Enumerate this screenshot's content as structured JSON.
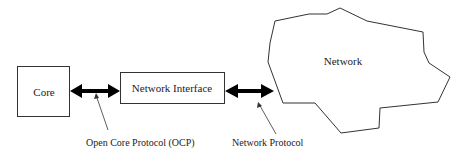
{
  "diagram": {
    "nodes": {
      "core": {
        "label": "Core"
      },
      "network_interface": {
        "label": "Network Interface"
      },
      "network": {
        "label": "Network"
      }
    },
    "connections": [
      {
        "from": "core",
        "to": "network_interface",
        "style": "bidirectional-thick-arrow",
        "label": "Open Core Protocol (OCP)"
      },
      {
        "from": "network_interface",
        "to": "network",
        "style": "bidirectional-thick-arrow",
        "label": "Network Protocol"
      }
    ],
    "labels": {
      "ocp": "Open Core Protocol (OCP)",
      "network_protocol": "Network Protocol"
    },
    "colors": {
      "stroke": "#333333",
      "arrow": "#000000",
      "text": "#222222",
      "background": "#ffffff"
    }
  }
}
